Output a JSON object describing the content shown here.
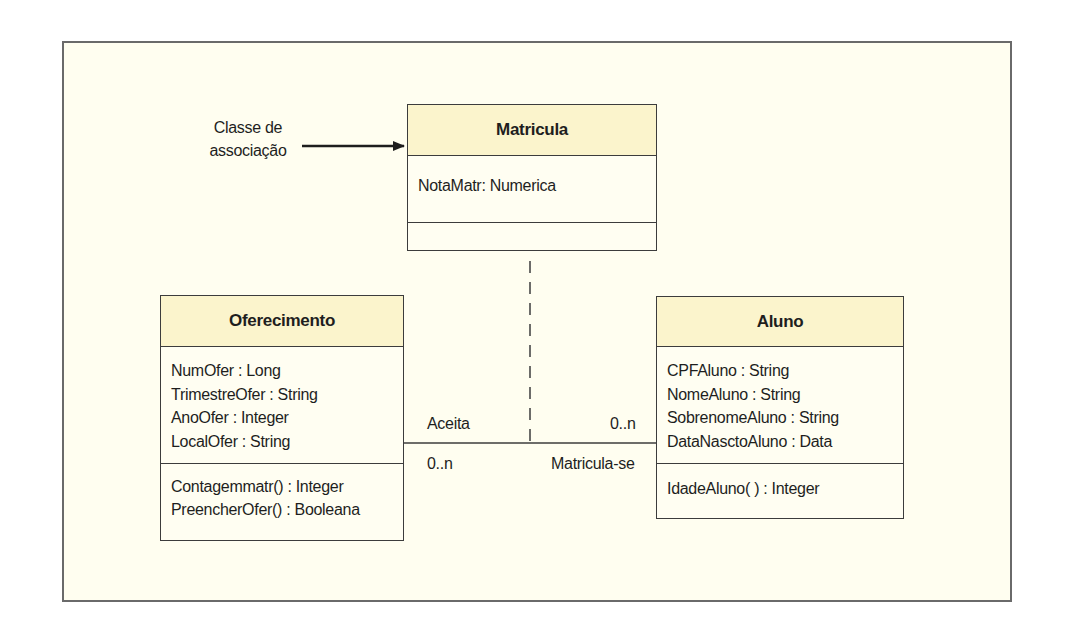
{
  "diagram": {
    "type": "UML class diagram",
    "note": {
      "line1": "Classe de",
      "line2": "associação"
    },
    "classes": {
      "matricula": {
        "name": "Matricula",
        "attributes": [
          "NotaMatr: Numerica"
        ],
        "operations": []
      },
      "oferecimento": {
        "name": "Oferecimento",
        "attributes": [
          "NumOfer : Long",
          "TrimestreOfer : String",
          "AnoOfer : Integer",
          "LocalOfer : String"
        ],
        "operations": [
          "Contagemmatr() : Integer",
          "PreencherOfer() : Booleana"
        ]
      },
      "aluno": {
        "name": "Aluno",
        "attributes": [
          "CPFAluno : String",
          "NomeAluno : String",
          "SobrenomeAluno : String",
          "DataNasctoAluno : Data"
        ],
        "operations": [
          "IdadeAluno( ) : Integer"
        ]
      }
    },
    "association": {
      "left_role": "Aceita",
      "left_multiplicity": "0..n",
      "right_multiplicity": "0..n",
      "right_role": "Matricula-se"
    },
    "colors": {
      "frame_bg": "#fffef0",
      "header_bg": "#fbf4cc",
      "border": "#3c3c3c"
    }
  }
}
